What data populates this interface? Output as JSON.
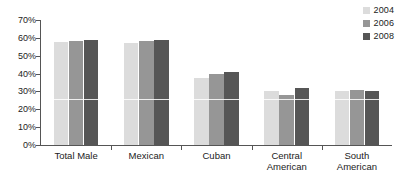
{
  "chart_data": {
    "type": "bar",
    "title": "",
    "subtitle": "",
    "xlabel": "",
    "ylabel": "",
    "categories": [
      "Total Male",
      "Mexican",
      "Cuban",
      "Central\nAmerican",
      "South\nAmerican"
    ],
    "series": [
      {
        "name": "2004",
        "values": [
          57.5,
          57.0,
          37.5,
          30.0,
          30.0
        ],
        "color": "#dcdcdc"
      },
      {
        "name": "2006",
        "values": [
          58.0,
          58.0,
          40.0,
          28.0,
          31.0
        ],
        "color": "#969696"
      },
      {
        "name": "2008",
        "values": [
          59.0,
          59.0,
          41.0,
          32.0,
          30.0
        ],
        "color": "#565656"
      }
    ],
    "ylim": [
      0,
      70
    ],
    "ytick_values": [
      0,
      10,
      20,
      30,
      40,
      50,
      60,
      70
    ],
    "ytick_labels": [
      "0%",
      "10%",
      "20%",
      "30%",
      "40%",
      "50%",
      "60%",
      "70%"
    ],
    "grid": false,
    "legend_position": "top-right",
    "axis_color": "#555555",
    "background_color": "#ffffff"
  },
  "legend": {
    "entries": [
      {
        "label": "2004",
        "color": "#dcdcdc"
      },
      {
        "label": "2006",
        "color": "#969696"
      },
      {
        "label": "2008",
        "color": "#565656"
      }
    ]
  }
}
